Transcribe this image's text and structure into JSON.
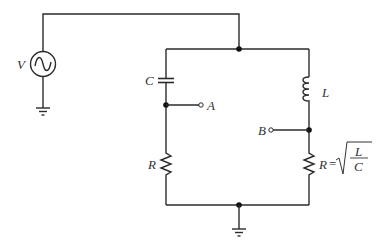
{
  "diagram": {
    "type": "circuit",
    "components": {
      "source": {
        "label": "V",
        "kind": "ac-voltage-source"
      },
      "capacitor": {
        "label": "C"
      },
      "inductor": {
        "label": "L"
      },
      "resistor_left": {
        "label": "R"
      },
      "resistor_right": {
        "label": "R",
        "equation_lhs": "R",
        "equals": "=",
        "numerator": "L",
        "denominator": "C"
      }
    },
    "terminals": {
      "a": {
        "label": "A"
      },
      "b": {
        "label": "B"
      }
    },
    "colors": {
      "wire": "#2b2b2b",
      "background": "#ffffff"
    }
  }
}
